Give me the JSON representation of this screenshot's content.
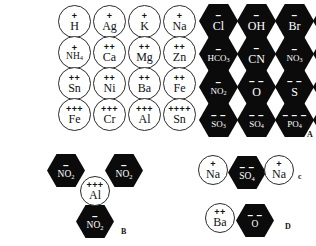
{
  "figure": {
    "panels": [
      {
        "id": "A",
        "label": "A"
      },
      {
        "id": "B",
        "label": "B"
      },
      {
        "id": "C",
        "label": "c"
      },
      {
        "id": "D",
        "label": "D"
      }
    ]
  },
  "colors": {
    "background": "#ffffff",
    "anion_fill": "#0b0b0b",
    "anion_text": "#ffffff",
    "cation_outline": "#2b2b2b",
    "cation_text": "#111111"
  },
  "panel_a": {
    "label": "A",
    "cations": [
      {
        "formula": "H",
        "sub": "",
        "charge": "+"
      },
      {
        "formula": "Ag",
        "sub": "",
        "charge": "+"
      },
      {
        "formula": "K",
        "sub": "",
        "charge": "+"
      },
      {
        "formula": "Na",
        "sub": "",
        "charge": "+"
      },
      {
        "formula": "NH",
        "sub": "4",
        "charge": "+"
      },
      {
        "formula": "Ca",
        "sub": "",
        "charge": "++"
      },
      {
        "formula": "Mg",
        "sub": "",
        "charge": "++"
      },
      {
        "formula": "Zn",
        "sub": "",
        "charge": "++"
      },
      {
        "formula": "Sn",
        "sub": "",
        "charge": "++"
      },
      {
        "formula": "Ni",
        "sub": "",
        "charge": "++"
      },
      {
        "formula": "Ba",
        "sub": "",
        "charge": "++"
      },
      {
        "formula": "Fe",
        "sub": "",
        "charge": "++"
      },
      {
        "formula": "Fe",
        "sub": "",
        "charge": "+++"
      },
      {
        "formula": "Cr",
        "sub": "",
        "charge": "+++"
      },
      {
        "formula": "Al",
        "sub": "",
        "charge": "+++"
      },
      {
        "formula": "Sn",
        "sub": "",
        "charge": "++++"
      }
    ],
    "anions": [
      {
        "formula": "Cl",
        "sub": "",
        "charge": "–"
      },
      {
        "formula": "OH",
        "sub": "",
        "charge": "–"
      },
      {
        "formula": "Br",
        "sub": "",
        "charge": "–"
      },
      {
        "formula": "ClO",
        "sub": "3",
        "charge": "–"
      },
      {
        "formula": "HCO",
        "sub": "3",
        "charge": "–"
      },
      {
        "formula": "CN",
        "sub": "",
        "charge": "–"
      },
      {
        "formula": "NO",
        "sub": "3",
        "charge": "–"
      },
      {
        "formula": "HSO",
        "sub": "4",
        "charge": "–"
      },
      {
        "formula": "NO",
        "sub": "2",
        "charge": "–"
      },
      {
        "formula": "O",
        "sub": "",
        "charge": "– –"
      },
      {
        "formula": "S",
        "sub": "",
        "charge": "– –"
      },
      {
        "formula": "Cr",
        "sub": "2",
        "formula2": "O",
        "sub2": "7",
        "charge": "– –"
      },
      {
        "formula": "SO",
        "sub": "3",
        "charge": "– –"
      },
      {
        "formula": "SO",
        "sub": "4",
        "charge": "– –"
      },
      {
        "formula": "PO",
        "sub": "4",
        "charge": "– – –"
      },
      {
        "formula": "Fe(CN)",
        "sub": "6",
        "charge": "– – –"
      }
    ]
  },
  "panel_b": {
    "label": "B",
    "center": {
      "formula": "Al",
      "sub": "",
      "charge": "+++"
    },
    "outer": [
      {
        "formula": "NO",
        "sub": "2",
        "charge": "–"
      },
      {
        "formula": "NO",
        "sub": "2",
        "charge": "–"
      },
      {
        "formula": "NO",
        "sub": "2",
        "charge": "–"
      }
    ]
  },
  "panel_c": {
    "label": "c",
    "items": [
      {
        "kind": "cation",
        "formula": "Na",
        "sub": "",
        "charge": "+"
      },
      {
        "kind": "anion",
        "formula": "SO",
        "sub": "4",
        "charge": "– –"
      },
      {
        "kind": "cation",
        "formula": "Na",
        "sub": "",
        "charge": "+"
      }
    ]
  },
  "panel_d": {
    "label": "D",
    "items": [
      {
        "kind": "cation",
        "formula": "Ba",
        "sub": "",
        "charge": "++"
      },
      {
        "kind": "anion",
        "formula": "O",
        "sub": "",
        "charge": "– –"
      }
    ]
  }
}
